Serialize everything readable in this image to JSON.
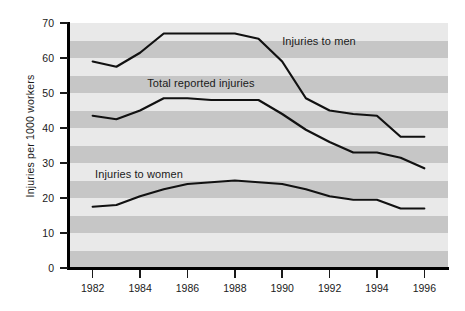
{
  "chart_data": {
    "type": "line",
    "title": "",
    "xlabel": "",
    "ylabel": "Injuries per 1000 workers",
    "x": [
      1982,
      1983,
      1984,
      1985,
      1986,
      1987,
      1988,
      1989,
      1990,
      1991,
      1992,
      1993,
      1994,
      1995,
      1996
    ],
    "xlim": [
      1981,
      1997
    ],
    "ylim": [
      0,
      70
    ],
    "ytick_labels": [
      "0",
      "10",
      "20",
      "30",
      "40",
      "50",
      "60",
      "70"
    ],
    "ytick_values": [
      0,
      10,
      20,
      30,
      40,
      50,
      60,
      70
    ],
    "xtick_labels": [
      "1982",
      "1984",
      "1986",
      "1988",
      "1990",
      "1992",
      "1994",
      "1996"
    ],
    "xtick_values": [
      1982,
      1984,
      1986,
      1988,
      1990,
      1992,
      1994,
      1996
    ],
    "grid": "horizontal-bands",
    "legend_position": "inline-annotations",
    "series": [
      {
        "name": "Injuries to men",
        "values": [
          59.0,
          57.5,
          61.5,
          67.0,
          67.0,
          67.0,
          67.0,
          65.5,
          59.0,
          48.5,
          45.0,
          44.0,
          43.5,
          37.5,
          37.5
        ]
      },
      {
        "name": "Total reported injuries",
        "values": [
          43.5,
          42.5,
          45.0,
          48.5,
          48.5,
          48.0,
          48.0,
          48.0,
          44.0,
          39.5,
          36.0,
          33.0,
          33.0,
          31.5,
          28.5
        ]
      },
      {
        "name": "Injuries to women",
        "values": [
          17.5,
          18.0,
          20.5,
          22.5,
          24.0,
          24.5,
          25.0,
          24.5,
          24.0,
          22.5,
          20.5,
          19.5,
          19.5,
          17.0,
          17.0
        ]
      }
    ],
    "annotations": [
      {
        "text": "Injuries to men",
        "x": 1990.0,
        "y": 64.5
      },
      {
        "text": "Total reported injuries",
        "x": 1984.3,
        "y": 52.5
      },
      {
        "text": "Injuries to women",
        "x": 1982.1,
        "y": 26.5
      }
    ],
    "colors": {
      "line": "#111111",
      "band_light": "#e9e9e9",
      "band_dark": "#c6c6c6",
      "axis": "#000000",
      "text": "#1a1a1a",
      "background": "#ffffff"
    }
  }
}
